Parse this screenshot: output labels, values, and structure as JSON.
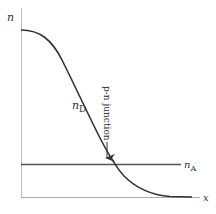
{
  "diagram": {
    "type": "p-n junction concentration profile",
    "axes": {
      "y_label": "n",
      "x_label": "x"
    },
    "curves": [
      {
        "id": "donor",
        "label_main": "n",
        "label_sub": "D",
        "description": "decreasing donor concentration profile"
      },
      {
        "id": "acceptor",
        "label_main": "n",
        "label_sub": "A",
        "description": "constant acceptor concentration"
      }
    ],
    "annotation": {
      "text": "p-n junction",
      "points_to": "intersection of n_D and n_A"
    },
    "colors": {
      "axis": "#bbbbbb",
      "curve": "#333333",
      "text": "#333333"
    }
  }
}
